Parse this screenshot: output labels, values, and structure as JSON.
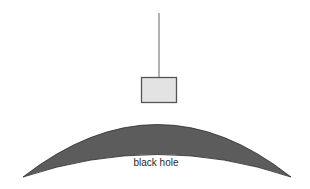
{
  "diagram": {
    "string": {
      "x": 159,
      "y1": 13,
      "y2": 77,
      "color": "#666666"
    },
    "box": {
      "x": 141,
      "y": 77,
      "width": 36,
      "height": 26,
      "fill": "#e3e3e3",
      "stroke": "#555555"
    },
    "horizon": {
      "fill": "#5a5a5a",
      "edge": "#2b2b2b",
      "label": "black hole"
    }
  }
}
